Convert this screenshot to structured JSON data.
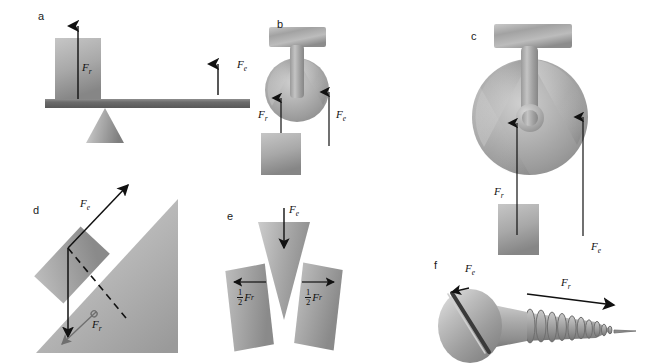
{
  "figure": {
    "background": "#ffffff",
    "ink": "#111111",
    "metal_light": "#d8d8d8",
    "metal_mid": "#a9a9a9",
    "metal_dark": "#787878",
    "bar_color": "#6d6d6d"
  },
  "panels": [
    {
      "id": "a",
      "letter": "a",
      "name": "lever",
      "labels": [
        {
          "text": "F",
          "sub": "r",
          "name": "force-label-fr"
        },
        {
          "text": "F",
          "sub": "e",
          "name": "force-label-fe"
        }
      ]
    },
    {
      "id": "b",
      "letter": "b",
      "name": "wheel-and-axle-small",
      "labels": [
        {
          "text": "F",
          "sub": "r",
          "name": "force-label-fr"
        },
        {
          "text": "F",
          "sub": "e",
          "name": "force-label-fe"
        }
      ]
    },
    {
      "id": "c",
      "letter": "c",
      "name": "wheel-and-axle-large",
      "labels": [
        {
          "text": "F",
          "sub": "r",
          "name": "force-label-fr"
        },
        {
          "text": "F",
          "sub": "e",
          "name": "force-label-fe"
        }
      ]
    },
    {
      "id": "d",
      "letter": "d",
      "name": "inclined-plane",
      "labels": [
        {
          "text": "F",
          "sub": "e",
          "name": "force-label-fe"
        },
        {
          "text": "F",
          "sub": "r",
          "name": "force-label-fr"
        }
      ]
    },
    {
      "id": "e",
      "letter": "e",
      "name": "wedge",
      "labels": [
        {
          "text": "F",
          "sub": "e",
          "name": "force-label-fe"
        },
        {
          "numerator": "1",
          "denominator": "2",
          "text": "F",
          "sub": "r",
          "name": "force-label-half-fr-left"
        },
        {
          "numerator": "1",
          "denominator": "2",
          "text": "F",
          "sub": "r",
          "name": "force-label-half-fr-right"
        }
      ]
    },
    {
      "id": "f",
      "letter": "f",
      "name": "screw",
      "labels": [
        {
          "text": "F",
          "sub": "e",
          "name": "force-label-fe"
        },
        {
          "text": "F",
          "sub": "r",
          "name": "force-label-fr"
        }
      ]
    }
  ]
}
